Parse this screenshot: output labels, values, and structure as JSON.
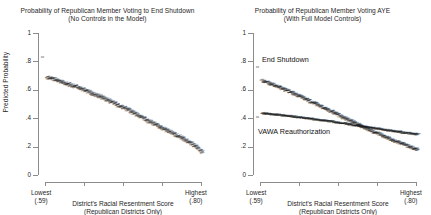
{
  "figure": {
    "panels": [
      {
        "id": "left",
        "title_line1": "Probability of Republican Member Voting to End Shutdown",
        "title_line2": "(No Controls in the Model)"
      },
      {
        "id": "right",
        "title_line1": "Probability of Republican Member Voting AYE",
        "title_line2": "(With Full Model Controls)"
      }
    ],
    "axes": {
      "y_title": "Predicted Probability",
      "y_ticks": [
        "0",
        ".2",
        ".4",
        ".6",
        ".8",
        "1"
      ],
      "x_title_line1": "District's Racial Resentment Score",
      "x_title_line2": "(Republican Districts Only)",
      "x_low_label": "Lowest",
      "x_low_value": "(.59)",
      "x_high_label": "Highest",
      "x_high_value": "(.80)"
    },
    "series_labels": {
      "end_shutdown": "End Shutdown",
      "vawa": "VAWA Reauthorization"
    }
  },
  "chart_data": [
    {
      "type": "scatter",
      "panel": "left",
      "title": "Probability of Republican Member Voting to End Shutdown (No Controls in the Model)",
      "xlabel": "District's Racial Resentment Score (Republican Districts Only)",
      "ylabel": "Predicted Probability",
      "xlim": [
        0.59,
        0.8
      ],
      "ylim": [
        0,
        1
      ],
      "xticklabels": [
        "Lowest (.59)",
        "",
        "",
        "",
        "Highest (.80)"
      ],
      "yticklabels": [
        "0",
        ".2",
        ".4",
        ".6",
        ".8",
        "1"
      ],
      "grid": false,
      "legend": "none",
      "series": [
        {
          "name": "End Shutdown (no controls)",
          "x": [
            0.59,
            0.6,
            0.61,
            0.62,
            0.63,
            0.64,
            0.65,
            0.66,
            0.67,
            0.68,
            0.69,
            0.7,
            0.71,
            0.72,
            0.73,
            0.74,
            0.75,
            0.76,
            0.77,
            0.78,
            0.79,
            0.8
          ],
          "values": [
            0.68,
            0.665,
            0.648,
            0.63,
            0.612,
            0.592,
            0.57,
            0.548,
            0.525,
            0.5,
            0.474,
            0.448,
            0.42,
            0.393,
            0.365,
            0.338,
            0.311,
            0.285,
            0.258,
            0.23,
            0.198,
            0.15
          ]
        }
      ]
    },
    {
      "type": "scatter",
      "panel": "right",
      "title": "Probability of Republican Member Voting AYE (With Full Model Controls)",
      "xlabel": "District's Racial Resentment Score (Republican Districts Only)",
      "ylabel": "Predicted Probability",
      "xlim": [
        0.59,
        0.8
      ],
      "ylim": [
        0,
        1
      ],
      "xticklabels": [
        "Lowest (.59)",
        "",
        "",
        "",
        "Highest (.80)"
      ],
      "yticklabels": [
        "0",
        ".2",
        ".4",
        ".6",
        ".8",
        "1"
      ],
      "grid": false,
      "legend": "inline-annotations",
      "series": [
        {
          "name": "End Shutdown",
          "x": [
            0.59,
            0.6,
            0.61,
            0.62,
            0.63,
            0.64,
            0.65,
            0.66,
            0.67,
            0.68,
            0.69,
            0.7,
            0.71,
            0.72,
            0.73,
            0.74,
            0.75,
            0.76,
            0.77,
            0.78,
            0.79,
            0.8
          ],
          "values": [
            0.66,
            0.64,
            0.62,
            0.598,
            0.575,
            0.551,
            0.527,
            0.502,
            0.477,
            0.451,
            0.425,
            0.399,
            0.374,
            0.349,
            0.324,
            0.3,
            0.277,
            0.255,
            0.233,
            0.212,
            0.192,
            0.172
          ]
        },
        {
          "name": "VAWA Reauthorization",
          "x": [
            0.59,
            0.6,
            0.61,
            0.62,
            0.63,
            0.64,
            0.65,
            0.66,
            0.67,
            0.68,
            0.69,
            0.7,
            0.71,
            0.72,
            0.73,
            0.74,
            0.75,
            0.76,
            0.77,
            0.78,
            0.79,
            0.8
          ],
          "values": [
            0.432,
            0.427,
            0.421,
            0.415,
            0.409,
            0.403,
            0.396,
            0.389,
            0.382,
            0.375,
            0.367,
            0.359,
            0.351,
            0.343,
            0.335,
            0.327,
            0.319,
            0.311,
            0.303,
            0.296,
            0.289,
            0.282
          ]
        }
      ],
      "annotations": [
        {
          "text": "End Shutdown",
          "x": 0.605,
          "y": 0.78
        },
        {
          "text": "VAWA Reauthorization",
          "x": 0.6,
          "y": 0.33
        }
      ]
    }
  ]
}
